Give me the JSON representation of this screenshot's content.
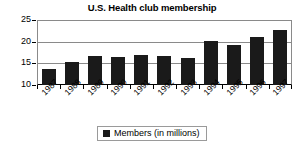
{
  "chart_data": {
    "type": "bar",
    "title": "U.S. Health club membership",
    "xlabel": "",
    "ylabel": "",
    "categories": [
      "1987",
      "1988",
      "1989",
      "1990",
      "1991",
      "1992",
      "1993",
      "1994",
      "1995",
      "1996",
      "1997"
    ],
    "values": [
      13.7,
      15.2,
      16.7,
      16.5,
      16.9,
      16.7,
      16.3,
      20.2,
      19.3,
      21.1,
      22.8
    ],
    "series": [
      {
        "name": "Members (in millions)",
        "values": [
          13.7,
          15.2,
          16.7,
          16.5,
          16.9,
          16.7,
          16.3,
          20.2,
          19.3,
          21.1,
          22.8
        ]
      }
    ],
    "ylim": [
      10,
      25
    ],
    "yticks": [
      10,
      15,
      20,
      25
    ],
    "ytick_labels": [
      "10",
      "15",
      "20",
      "25"
    ],
    "grid": true,
    "grid_axis": "y",
    "legend": [
      "Members (in millions)"
    ],
    "legend_position": "bottom-center",
    "bar_color": "#1a1a1a",
    "grid_color": "#8a8a8a",
    "background_color": "#ffffff",
    "xtick_label_rotation": -45
  },
  "legend": {
    "label": "Members (in millions)"
  }
}
